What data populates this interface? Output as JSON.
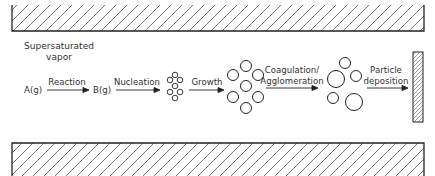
{
  "diagram": {
    "title_text": [
      "Supersaturated",
      "vapor"
    ],
    "species": {
      "a": "A(g)",
      "b": "B(g)"
    },
    "steps": [
      {
        "label": "Reaction"
      },
      {
        "label": "Nucleation"
      },
      {
        "label": "Growth"
      },
      {
        "label_line1": "Coagulation/",
        "label_line2": "Agglomeration"
      },
      {
        "label_line1": "Particle",
        "label_line2": "deposition"
      }
    ],
    "colors": {
      "stroke": "#222222",
      "text": "#333333",
      "hatch": "#555555",
      "background": "#ffffff"
    }
  }
}
